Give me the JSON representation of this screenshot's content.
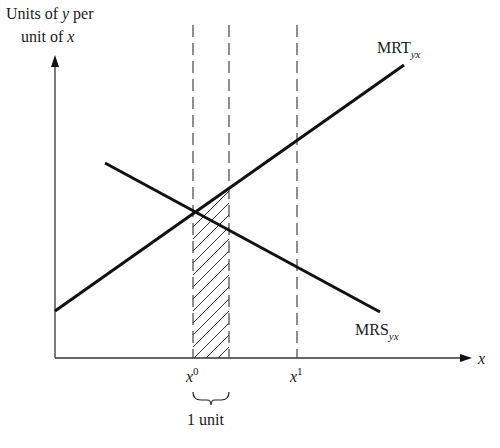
{
  "diagram": {
    "y_axis_label_line1_prefix": "Units of ",
    "y_axis_label_line1_var": "y",
    "y_axis_label_line1_suffix": " per",
    "y_axis_label_line2_prefix": "unit of ",
    "y_axis_label_line2_var": "x",
    "x_axis_label": "x",
    "curves": [
      {
        "name": "MRT",
        "base": "MRT",
        "subscript": "yx",
        "slope": "upward"
      },
      {
        "name": "MRS",
        "base": "MRS",
        "subscript": "yx",
        "slope": "downward"
      }
    ],
    "ticks": [
      {
        "base": "x",
        "superscript": "0"
      },
      {
        "base": "x",
        "superscript": "1"
      }
    ],
    "brace_label": "1 unit",
    "colors": {
      "line": "#111111",
      "dashed": "#444444",
      "hatch": "#333333",
      "background": "#ffffff"
    }
  }
}
